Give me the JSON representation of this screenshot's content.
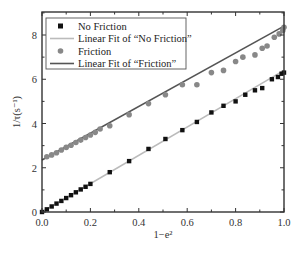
{
  "chart_data": {
    "type": "scatter",
    "title": "",
    "xlabel": "1−e²",
    "ylabel": "1/τ(s⁻¹)",
    "xlim": [
      0.0,
      1.0
    ],
    "ylim": [
      0,
      9
    ],
    "xticks": [
      "0.0",
      "0.2",
      "0.4",
      "0.6",
      "0.8",
      "1.0"
    ],
    "yticks": [
      "0",
      "2",
      "4",
      "6",
      "8"
    ],
    "grid": false,
    "legend_position": "upper left",
    "legend": [
      "No Friction",
      "Linear Fit of “No Friction”",
      "Friction",
      "Linear Fit of “Friction”"
    ],
    "series": [
      {
        "name": "No Friction",
        "marker": "square",
        "color": "#111111",
        "x": [
          0.0,
          0.02,
          0.04,
          0.06,
          0.08,
          0.1,
          0.12,
          0.14,
          0.16,
          0.18,
          0.2,
          0.28,
          0.36,
          0.44,
          0.51,
          0.58,
          0.64,
          0.7,
          0.75,
          0.8,
          0.84,
          0.88,
          0.91,
          0.95,
          0.975,
          0.99,
          1.0
        ],
        "y": [
          0.0,
          0.12,
          0.25,
          0.38,
          0.5,
          0.63,
          0.76,
          0.89,
          1.02,
          1.14,
          1.27,
          1.8,
          2.3,
          2.85,
          3.3,
          3.7,
          4.07,
          4.5,
          4.8,
          5.0,
          5.3,
          5.5,
          5.6,
          6.0,
          6.1,
          6.25,
          6.3
        ]
      },
      {
        "name": "Linear Fit of “No Friction”",
        "type": "line",
        "color": "#bbbbbb",
        "x": [
          0.0,
          1.0
        ],
        "y": [
          0.0,
          6.4
        ]
      },
      {
        "name": "Friction",
        "marker": "circle",
        "color": "#888888",
        "x": [
          0.02,
          0.04,
          0.06,
          0.08,
          0.1,
          0.12,
          0.14,
          0.16,
          0.18,
          0.2,
          0.22,
          0.24,
          0.28,
          0.36,
          0.44,
          0.51,
          0.58,
          0.64,
          0.7,
          0.75,
          0.8,
          0.83,
          0.88,
          0.91,
          0.93,
          0.96,
          0.98,
          0.995,
          1.0
        ],
        "y": [
          2.5,
          2.58,
          2.68,
          2.8,
          2.92,
          3.02,
          3.14,
          3.25,
          3.37,
          3.48,
          3.6,
          3.75,
          3.9,
          4.4,
          4.9,
          5.3,
          5.75,
          5.75,
          6.3,
          6.4,
          6.8,
          7.0,
          7.1,
          7.4,
          7.5,
          7.9,
          8.05,
          8.2,
          8.35
        ]
      },
      {
        "name": "Linear Fit of “Friction”",
        "type": "line",
        "color": "#555555",
        "x": [
          0.0,
          1.0
        ],
        "y": [
          2.35,
          8.4
        ]
      }
    ]
  }
}
